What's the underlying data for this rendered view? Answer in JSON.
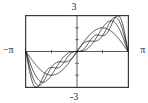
{
  "figure": {
    "title": "",
    "frame": {
      "x": 25,
      "y": 15,
      "width": 104,
      "height": 73
    }
  },
  "labels": {
    "y_max": "3",
    "y_min": "-3",
    "x_min": "−π",
    "x_max": "π"
  },
  "style": {
    "frame_color": "#3a3a3a",
    "axis_color": "#4a4a4a",
    "curve_color": "#1a1a1a",
    "background": "#ffffff"
  },
  "chart_data": {
    "type": "line",
    "title": "",
    "xlabel": "",
    "ylabel": "",
    "xlim": [
      -3.14159,
      3.14159
    ],
    "ylim": [
      -3,
      3
    ],
    "xticks": [
      -3.14159,
      -1.5708,
      0,
      1.5708,
      3.14159
    ],
    "xticklabels": [
      "−π",
      "",
      "0",
      "",
      "π"
    ],
    "yticks": [
      -3,
      -2,
      -1,
      0,
      1,
      2,
      3
    ],
    "yticklabels": [
      "-3",
      "",
      "",
      "",
      "",
      "",
      "3"
    ],
    "grid": false,
    "legend": "none",
    "annotation": "Fourier sine-series partial sums of a sawtooth wave f(x)=x on (−π,π); Gibbs overshoot visible near x=±π",
    "series": [
      {
        "name": "N = 1",
        "terms": 1,
        "x": [
          -3.14159,
          -2.74889,
          -2.35619,
          -1.9635,
          -1.5708,
          -1.1781,
          -0.7854,
          -0.3927,
          0,
          0.3927,
          0.7854,
          1.1781,
          1.5708,
          1.9635,
          2.35619,
          2.74889,
          3.14159
        ],
        "y": [
          0,
          -0.7654,
          -1.4142,
          -1.8478,
          -2,
          -1.8478,
          -1.4142,
          -0.7654,
          0,
          0.7654,
          1.4142,
          1.8478,
          2,
          1.8478,
          1.4142,
          0.7654,
          0
        ]
      },
      {
        "name": "N = 2",
        "terms": 2,
        "x": [
          -3.14159,
          -2.74889,
          -2.35619,
          -1.9635,
          -1.5708,
          -1.1781,
          -0.7854,
          -0.3927,
          0,
          0.3927,
          0.7854,
          1.1781,
          1.5708,
          1.9635,
          2.35619,
          2.74889,
          3.14159
        ],
        "y": [
          0,
          -1.7071,
          -2.4142,
          -2.1549,
          -2,
          -2.2192,
          -2.4142,
          -1.7071,
          0,
          1.7071,
          2.4142,
          2.2192,
          2,
          2.1549,
          2.4142,
          1.7071,
          0
        ]
      },
      {
        "name": "N = 3",
        "terms": 3,
        "x": [
          -3.14159,
          -2.74889,
          -2.35619,
          -1.9635,
          -1.5708,
          -1.1781,
          -0.7854,
          -0.3927,
          0,
          0.3927,
          0.7854,
          1.1781,
          1.5708,
          1.9635,
          2.35619,
          2.35619,
          2.74889,
          3.14159
        ],
        "y": [
          0,
          -2.2404,
          -2.4142,
          -1.9092,
          -2.6667,
          -2.4436,
          -2.4142,
          -2.0738,
          0,
          2.0738,
          2.4142,
          2.4436,
          2.6667,
          1.9092,
          2.4142,
          2.4142,
          2.2404,
          0
        ]
      },
      {
        "name": "N = 4",
        "terms": 4,
        "x": [
          -3.14159,
          -2.74889,
          -2.35619,
          -1.9635,
          -1.5708,
          -1.1781,
          -0.7854,
          -0.3927,
          0,
          0.3927,
          0.7854,
          1.1781,
          1.5708,
          1.9635,
          2.35619,
          2.74889,
          3.14159
        ],
        "y": [
          0,
          -2.8481,
          -2.0607,
          -2.4735,
          -2.6667,
          -2.2192,
          -2.7678,
          -2.4232,
          0,
          2.4232,
          2.7678,
          2.2192,
          2.6667,
          2.4735,
          2.0607,
          2.8481,
          0
        ]
      }
    ]
  }
}
